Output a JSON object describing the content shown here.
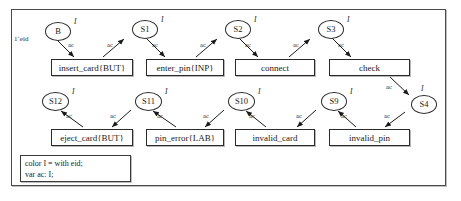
{
  "diagram": {
    "frame_border_color": "#4a4a4a",
    "background": "#ffffff",
    "node_color_type": "I",
    "arc_inscription": "ac",
    "initial_marking": "1`eid"
  },
  "places": [
    {
      "id": "B",
      "label": "B",
      "color_set": "I",
      "x": 45,
      "y": 22,
      "w": 26,
      "h": 19
    },
    {
      "id": "S1",
      "label": "S1",
      "color_set": "I",
      "x": 132,
      "y": 20,
      "w": 26,
      "h": 19
    },
    {
      "id": "S2",
      "label": "S2",
      "color_set": "I",
      "x": 225,
      "y": 20,
      "w": 26,
      "h": 19
    },
    {
      "id": "S3",
      "label": "S3",
      "color_set": "I",
      "x": 318,
      "y": 20,
      "w": 26,
      "h": 19
    },
    {
      "id": "S4",
      "label": "S4",
      "color_set": "I",
      "x": 411,
      "y": 95,
      "w": 26,
      "h": 19
    },
    {
      "id": "S9",
      "label": "S9",
      "color_set": "I",
      "x": 321,
      "y": 92,
      "w": 26,
      "h": 19
    },
    {
      "id": "S10",
      "label": "S10",
      "color_set": "I",
      "x": 228,
      "y": 92,
      "w": 27,
      "h": 19
    },
    {
      "id": "S11",
      "label": "S11",
      "color_set": "I",
      "x": 135,
      "y": 92,
      "w": 27,
      "h": 19
    },
    {
      "id": "S12",
      "label": "S12",
      "color_set": "I",
      "x": 42,
      "y": 92,
      "w": 27,
      "h": 19
    }
  ],
  "transitions": [
    {
      "id": "insert_card",
      "label": "insert_card{BUT}",
      "x": 51,
      "y": 59,
      "w": 82,
      "h": 17
    },
    {
      "id": "enter_pin",
      "label": "enter_pin{INP}",
      "x": 146,
      "y": 59,
      "w": 78,
      "h": 17
    },
    {
      "id": "connect",
      "label": "connect",
      "x": 235,
      "y": 59,
      "w": 80,
      "h": 17
    },
    {
      "id": "check",
      "label": "check",
      "x": 329,
      "y": 59,
      "w": 81,
      "h": 17
    },
    {
      "id": "eject_card",
      "label": "eject_card{BUT}",
      "x": 51,
      "y": 129,
      "w": 82,
      "h": 17
    },
    {
      "id": "pin_error",
      "label": "pin_error{LAB}",
      "x": 146,
      "y": 129,
      "w": 78,
      "h": 17
    },
    {
      "id": "invalid_card",
      "label": "invalid_card",
      "x": 235,
      "y": 129,
      "w": 80,
      "h": 17
    },
    {
      "id": "invalid_pin",
      "label": "invalid_pin",
      "x": 329,
      "y": 129,
      "w": 81,
      "h": 17
    }
  ],
  "arcs": [
    {
      "id": "b-to-insert",
      "from": "B",
      "to": "insert_card",
      "label": "ac",
      "lx": 68,
      "ly": 42
    },
    {
      "id": "insert-to-s1",
      "from": "insert_card",
      "to": "S1",
      "label": "ac",
      "lx": 110,
      "ly": 42
    },
    {
      "id": "s1-to-enter",
      "from": "S1",
      "to": "enter_pin",
      "label": "ac",
      "lx": 152,
      "ly": 42
    },
    {
      "id": "enter-to-s2",
      "from": "enter_pin",
      "to": "S2",
      "label": "ac",
      "lx": 203,
      "ly": 42
    },
    {
      "id": "s2-to-connect",
      "from": "S2",
      "to": "connect",
      "label": "ac",
      "lx": 245,
      "ly": 42
    },
    {
      "id": "connect-to-s3",
      "from": "connect",
      "to": "S3",
      "label": "ac",
      "lx": 296,
      "ly": 42
    },
    {
      "id": "s3-to-check",
      "from": "S3",
      "to": "check",
      "label": "ac",
      "lx": 338,
      "ly": 42
    },
    {
      "id": "check-to-s4",
      "from": "check",
      "to": "S4",
      "label": "ac",
      "lx": 387,
      "ly": 86
    },
    {
      "id": "s4-to-invalid-pin",
      "from": "S4",
      "to": "invalid_pin",
      "label": "ac",
      "lx": 383,
      "ly": 114
    },
    {
      "id": "invalid-pin-to-s9",
      "from": "invalid_pin",
      "to": "S9",
      "label": "ac",
      "lx": 341,
      "ly": 114
    },
    {
      "id": "s9-to-invalid-card",
      "from": "S9",
      "to": "invalid_card",
      "label": "ac",
      "lx": 296,
      "ly": 114
    },
    {
      "id": "invalid-card-to-s10",
      "from": "invalid_card",
      "to": "S10",
      "label": "ac",
      "lx": 249,
      "ly": 114
    },
    {
      "id": "s10-to-pin-error",
      "from": "S10",
      "to": "pin_error",
      "label": "ac",
      "lx": 203,
      "ly": 114
    },
    {
      "id": "pin-error-to-s11",
      "from": "pin_error",
      "to": "S11",
      "label": "ac",
      "lx": 156,
      "ly": 114
    },
    {
      "id": "s11-to-eject",
      "from": "S11",
      "to": "eject_card",
      "label": "ac",
      "lx": 110,
      "ly": 114
    },
    {
      "id": "eject-to-s12",
      "from": "eject_card",
      "to": "S12",
      "label": "ac",
      "lx": 66,
      "ly": 114
    }
  ],
  "declarations": {
    "lines": [
      "color I = with eid;",
      "var ac: I;"
    ]
  }
}
